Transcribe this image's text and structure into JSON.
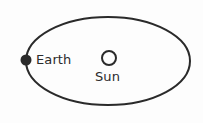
{
  "diagram": {
    "background_color": "#fdfdfd",
    "stroke_color": "#2a2a2a",
    "text_color": "#2b2b2b",
    "orbit": {
      "icon": "ellipse-orbit-path",
      "center_x": 108,
      "center_y": 61,
      "radius_x": 82,
      "radius_y": 44,
      "stroke_width": 2,
      "fill": "none"
    },
    "earth": {
      "label": "Earth",
      "icon": "filled-circle-earth",
      "center_x": 26,
      "center_y": 60,
      "radius": 5.5,
      "fill": "#2a2a2a"
    },
    "sun": {
      "label": "Sun",
      "icon": "hollow-circle-sun",
      "center_x": 109,
      "center_y": 58,
      "radius": 7,
      "stroke_width": 2,
      "fill": "none"
    }
  }
}
